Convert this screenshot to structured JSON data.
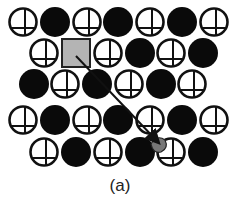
{
  "figure": {
    "caption": "(a)",
    "colors": {
      "filled_atom": "#0a0a0a",
      "open_atom_stroke": "#111111",
      "vacancy_square": "#b4b4b4",
      "arrow": "#111111",
      "displaced_atom": "#777777"
    },
    "radius": 15,
    "rows": [
      {
        "y": 22,
        "atoms": [
          {
            "x": 23,
            "type": "open"
          },
          {
            "x": 55,
            "type": "filled"
          },
          {
            "x": 87,
            "type": "open"
          },
          {
            "x": 118,
            "type": "filled"
          },
          {
            "x": 150,
            "type": "open"
          },
          {
            "x": 182,
            "type": "filled"
          },
          {
            "x": 214,
            "type": "open"
          }
        ]
      },
      {
        "y": 53,
        "atoms": [
          {
            "x": 44,
            "type": "open"
          },
          {
            "x": 76,
            "type": "vacancy"
          },
          {
            "x": 108,
            "type": "open"
          },
          {
            "x": 140,
            "type": "filled"
          },
          {
            "x": 171,
            "type": "open"
          },
          {
            "x": 203,
            "type": "filled"
          }
        ]
      },
      {
        "y": 84,
        "atoms": [
          {
            "x": 34,
            "type": "filled"
          },
          {
            "x": 65,
            "type": "open"
          },
          {
            "x": 97,
            "type": "filled"
          },
          {
            "x": 129,
            "type": "open"
          },
          {
            "x": 161,
            "type": "filled"
          },
          {
            "x": 192,
            "type": "open"
          }
        ]
      },
      {
        "y": 120,
        "atoms": [
          {
            "x": 23,
            "type": "open"
          },
          {
            "x": 55,
            "type": "filled"
          },
          {
            "x": 87,
            "type": "open"
          },
          {
            "x": 118,
            "type": "filled"
          },
          {
            "x": 150,
            "type": "open"
          },
          {
            "x": 182,
            "type": "filled"
          },
          {
            "x": 214,
            "type": "open"
          }
        ]
      },
      {
        "y": 152,
        "atoms": [
          {
            "x": 44,
            "type": "open"
          },
          {
            "x": 76,
            "type": "filled"
          },
          {
            "x": 108,
            "type": "open"
          },
          {
            "x": 140,
            "type": "filled"
          },
          {
            "x": 171,
            "type": "open"
          },
          {
            "x": 203,
            "type": "filled"
          }
        ]
      }
    ],
    "arrow": {
      "x1": 76,
      "y1": 56,
      "x2": 158,
      "y2": 142
    },
    "displaced": {
      "x": 160,
      "y": 146
    }
  }
}
